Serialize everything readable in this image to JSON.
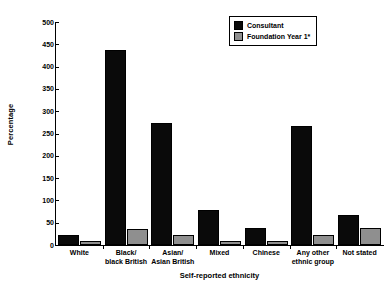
{
  "chart_data": {
    "type": "bar",
    "title": "",
    "xlabel": "Self-reported ethnicity",
    "ylabel": "Percentage",
    "ylim": [
      0,
      500
    ],
    "yticks": [
      0,
      50,
      100,
      150,
      200,
      250,
      300,
      350,
      400,
      450,
      500
    ],
    "grid": false,
    "legend_position": "top-right",
    "categories": [
      "White",
      "Black/ black British",
      "Asian/ Asian British",
      "Mixed",
      "Chinese",
      "Any other ethnic group",
      "Not stated"
    ],
    "category_lines": [
      [
        "White"
      ],
      [
        "Black/",
        "black British"
      ],
      [
        "Asian/",
        "Asian British"
      ],
      [
        "Mixed"
      ],
      [
        "Chinese"
      ],
      [
        "Any other",
        "ethnic group"
      ],
      [
        "Not stated"
      ]
    ],
    "series": [
      {
        "name": "Consultant",
        "color": "#0a0a0a",
        "values": [
          22,
          437,
          274,
          78,
          38,
          267,
          67
        ]
      },
      {
        "name": "Foundation Year 1*",
        "color": "#8f8f8f",
        "values": [
          10,
          35,
          22,
          10,
          8,
          22,
          38
        ]
      }
    ]
  },
  "legend": {
    "items": [
      {
        "label": "Consultant",
        "swatch": "consultant"
      },
      {
        "label": "Foundation Year 1*",
        "swatch": "fy1"
      }
    ]
  },
  "axis": {
    "y_title": "Percentage",
    "x_title": "Self-reported ethnicity"
  }
}
